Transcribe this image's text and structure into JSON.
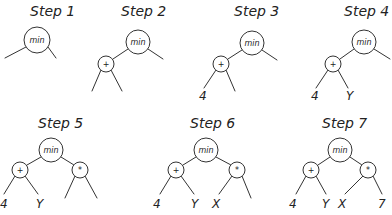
{
  "steps": [
    {
      "label": "Step 1",
      "label_pos": [
        30,
        16
      ],
      "nodes": [
        {
          "id": "min",
          "text": "min",
          "cx": 37,
          "cy": 40,
          "r": 13
        }
      ],
      "edges": [
        [
          26,
          47,
          5,
          58
        ],
        [
          48,
          47,
          56,
          58
        ]
      ],
      "leaves": []
    },
    {
      "label": "Step 2",
      "label_pos": [
        121,
        16
      ],
      "nodes": [
        {
          "id": "min",
          "text": "min",
          "cx": 138,
          "cy": 42,
          "r": 12
        },
        {
          "id": "plus",
          "text": "+",
          "cx": 106,
          "cy": 64,
          "r": 8
        }
      ],
      "edges": [
        [
          128,
          49,
          113,
          59
        ],
        [
          148,
          49,
          163,
          59
        ],
        [
          101,
          70,
          92,
          91
        ],
        [
          111,
          70,
          122,
          91
        ]
      ],
      "leaves": []
    },
    {
      "label": "Step 3",
      "label_pos": [
        234,
        16
      ],
      "nodes": [
        {
          "id": "min",
          "text": "min",
          "cx": 252,
          "cy": 43,
          "r": 12
        },
        {
          "id": "plus",
          "text": "+",
          "cx": 221,
          "cy": 64,
          "r": 8
        }
      ],
      "edges": [
        [
          242,
          50,
          228,
          59
        ],
        [
          262,
          50,
          277,
          60
        ],
        [
          216,
          70,
          204,
          88
        ],
        [
          226,
          70,
          235,
          91
        ]
      ],
      "leaves": [
        {
          "text": "4",
          "x": 199,
          "y": 100
        }
      ]
    },
    {
      "label": "Step 4",
      "label_pos": [
        344,
        16
      ],
      "nodes": [
        {
          "id": "min",
          "text": "min",
          "cx": 364,
          "cy": 42,
          "r": 12
        },
        {
          "id": "plus",
          "text": "+",
          "cx": 333,
          "cy": 64,
          "r": 8
        }
      ],
      "edges": [
        [
          354,
          49,
          340,
          59
        ],
        [
          374,
          49,
          390,
          59
        ],
        [
          328,
          70,
          316,
          88
        ],
        [
          338,
          70,
          348,
          88
        ]
      ],
      "leaves": [
        {
          "text": "4",
          "x": 311,
          "y": 100
        },
        {
          "text": "Y",
          "x": 346,
          "y": 100
        }
      ]
    },
    {
      "label": "Step 5",
      "label_pos": [
        38,
        128
      ],
      "nodes": [
        {
          "id": "min",
          "text": "min",
          "cx": 51,
          "cy": 150,
          "r": 12
        },
        {
          "id": "plus",
          "text": "+",
          "cx": 20,
          "cy": 170,
          "r": 8
        },
        {
          "id": "mul",
          "text": "*",
          "cx": 80,
          "cy": 170,
          "r": 8
        }
      ],
      "edges": [
        [
          41,
          157,
          27,
          165
        ],
        [
          61,
          157,
          74,
          165
        ],
        [
          15,
          176,
          4,
          194
        ],
        [
          25,
          176,
          38,
          194
        ],
        [
          75,
          176,
          65,
          198
        ],
        [
          85,
          176,
          97,
          198
        ]
      ],
      "leaves": [
        {
          "text": "4",
          "x": 0,
          "y": 208
        },
        {
          "text": "Y",
          "x": 36,
          "y": 208
        }
      ]
    },
    {
      "label": "Step 6",
      "label_pos": [
        190,
        128
      ],
      "nodes": [
        {
          "id": "min",
          "text": "min",
          "cx": 206,
          "cy": 150,
          "r": 12
        },
        {
          "id": "plus",
          "text": "+",
          "cx": 176,
          "cy": 170,
          "r": 8
        },
        {
          "id": "mul",
          "text": "*",
          "cx": 237,
          "cy": 170,
          "r": 8
        }
      ],
      "edges": [
        [
          196,
          157,
          183,
          165
        ],
        [
          216,
          157,
          231,
          165
        ],
        [
          171,
          176,
          160,
          194
        ],
        [
          181,
          176,
          194,
          194
        ],
        [
          232,
          176,
          219,
          194
        ],
        [
          242,
          176,
          251,
          198
        ]
      ],
      "leaves": [
        {
          "text": "4",
          "x": 153,
          "y": 208
        },
        {
          "text": "Y",
          "x": 191,
          "y": 208
        },
        {
          "text": "X",
          "x": 212,
          "y": 208
        }
      ]
    },
    {
      "label": "Step 7",
      "label_pos": [
        322,
        128
      ],
      "nodes": [
        {
          "id": "min",
          "text": "min",
          "cx": 340,
          "cy": 150,
          "r": 12
        },
        {
          "id": "plus",
          "text": "+",
          "cx": 311,
          "cy": 170,
          "r": 8
        },
        {
          "id": "mul",
          "text": "*",
          "cx": 368,
          "cy": 170,
          "r": 8
        }
      ],
      "edges": [
        [
          330,
          157,
          318,
          165
        ],
        [
          350,
          157,
          362,
          165
        ],
        [
          306,
          176,
          296,
          194
        ],
        [
          316,
          176,
          326,
          194
        ],
        [
          363,
          176,
          345,
          194
        ],
        [
          373,
          176,
          382,
          194
        ]
      ],
      "leaves": [
        {
          "text": "4",
          "x": 289,
          "y": 208
        },
        {
          "text": "Y",
          "x": 322,
          "y": 208
        },
        {
          "text": "X",
          "x": 338,
          "y": 208
        },
        {
          "text": "7",
          "x": 378,
          "y": 208
        }
      ]
    }
  ]
}
